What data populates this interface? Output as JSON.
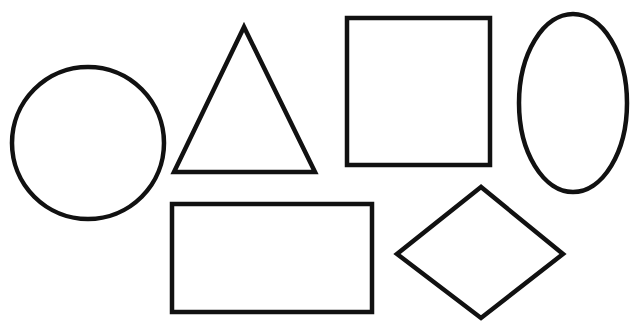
{
  "canvas": {
    "width": 638,
    "height": 326,
    "background": "#ffffff"
  },
  "style": {
    "stroke": "#111111",
    "fill": "#ffffff",
    "stroke_width": 4.5
  },
  "shapes": [
    {
      "name": "circle",
      "type": "circle",
      "cx": 88,
      "cy": 143,
      "r": 76
    },
    {
      "name": "triangle",
      "type": "polygon",
      "points": "244,27 174,172 315,172"
    },
    {
      "name": "square",
      "type": "rect",
      "x": 347,
      "y": 18,
      "width": 143,
      "height": 147
    },
    {
      "name": "ellipse",
      "type": "ellipse",
      "cx": 573,
      "cy": 103,
      "rx": 54,
      "ry": 89
    },
    {
      "name": "rectangle",
      "type": "rect",
      "x": 172,
      "y": 204,
      "width": 200,
      "height": 108
    },
    {
      "name": "diamond",
      "type": "polygon",
      "points": "481,187 397,254 481,318 563,254"
    }
  ]
}
